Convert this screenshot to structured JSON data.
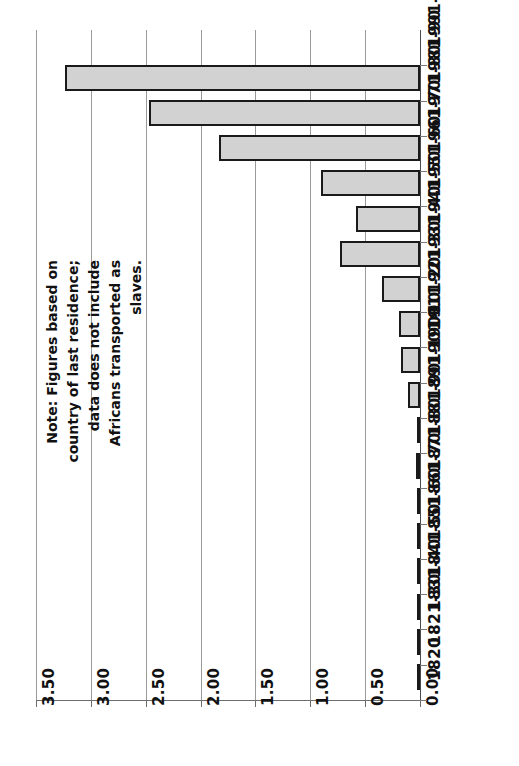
{
  "chart_data": {
    "type": "bar",
    "orientation": "horizontal",
    "title": "",
    "subtitle": "",
    "xlabel": "",
    "ylabel": "",
    "xlim": [
      0.0,
      3.5
    ],
    "axis_reversed": true,
    "rotated_180": true,
    "grid": true,
    "legend": null,
    "x_ticks": [
      "3.50",
      "3.00",
      "2.50",
      "2.00",
      "1.50",
      "1.00",
      "0.50",
      "0.00"
    ],
    "x_tick_values": [
      3.5,
      3.0,
      2.5,
      2.0,
      1.5,
      1.0,
      0.5,
      0.0
    ],
    "categories": [
      "1991-96",
      "1981-90",
      "1971-80",
      "1961-70",
      "1951-60",
      "1941-50",
      "1931-40",
      "1921-30",
      "1911-20",
      "1901-10",
      "1891-1900",
      "1881-90",
      "1871-80",
      "1861-70",
      "1851-60",
      "1841-50",
      "1831-40",
      "1821-30",
      "1820"
    ],
    "values": [
      3.24,
      2.47,
      1.83,
      0.9,
      0.58,
      0.73,
      0.35,
      0.19,
      0.17,
      0.11,
      0.03,
      0.04,
      0.03,
      0.03,
      0.03,
      0.02,
      0.03,
      0.02,
      0.0
    ],
    "annotation": "Note: Figures based on country of last residence; data does not include Africans transported as slaves.",
    "bar_fill_color": "#d2d2d2",
    "bar_edge_color": "#1a1a1a",
    "grid_color": "#9a9a9a",
    "background_color": "#ffffff"
  },
  "note": {
    "text": "Note: Figures based on country of last residence; data does not include Africans transported as slaves."
  }
}
